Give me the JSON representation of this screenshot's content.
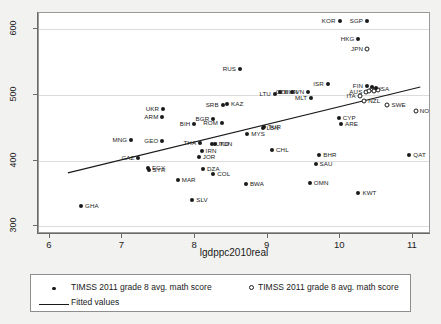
{
  "chart_data": {
    "type": "scatter",
    "title": "",
    "xlabel": "lgdppc2010real",
    "ylabel": "",
    "xlim": [
      5.85,
      11.25
    ],
    "ylim": [
      288,
      625
    ],
    "xticks": [
      "6",
      "7",
      "8",
      "9",
      "10",
      "11"
    ],
    "yticks": [
      "300",
      "400",
      "500",
      "600"
    ],
    "grid": "horizontal",
    "legend_position": "below-plot",
    "series": [
      {
        "name": "TIMSS 2011 grade 8 avg. math score",
        "marker": "filled-circle",
        "points": [
          {
            "label": "GHA",
            "x": 6.43,
            "y": 331,
            "lpos": "right"
          },
          {
            "label": "MNG",
            "x": 7.12,
            "y": 431,
            "lpos": "left"
          },
          {
            "label": "UKR",
            "x": 7.56,
            "y": 479,
            "lpos": "left"
          },
          {
            "label": "ARM",
            "x": 7.55,
            "y": 467,
            "lpos": "left"
          },
          {
            "label": "GEO",
            "x": 7.55,
            "y": 430,
            "lpos": "left"
          },
          {
            "label": "GAZ",
            "x": 7.22,
            "y": 404,
            "lpos": "left"
          },
          {
            "label": "EGY",
            "x": 7.35,
            "y": 388,
            "lpos": "right"
          },
          {
            "label": "SYR",
            "x": 7.36,
            "y": 385,
            "lpos": "right"
          },
          {
            "label": "MAR",
            "x": 7.76,
            "y": 371,
            "lpos": "right"
          },
          {
            "label": "SLV",
            "x": 7.96,
            "y": 340,
            "lpos": "right"
          },
          {
            "label": "BIH",
            "x": 7.99,
            "y": 456,
            "lpos": "left"
          },
          {
            "label": "JOR",
            "x": 8.05,
            "y": 406,
            "lpos": "right"
          },
          {
            "label": "THA",
            "x": 8.07,
            "y": 427,
            "lpos": "left"
          },
          {
            "label": "IRN",
            "x": 8.09,
            "y": 415,
            "lpos": "right"
          },
          {
            "label": "DZA",
            "x": 8.11,
            "y": 387,
            "lpos": "right"
          },
          {
            "label": "BGR",
            "x": 8.25,
            "y": 463,
            "lpos": "left"
          },
          {
            "label": "COL",
            "x": 8.25,
            "y": 379,
            "lpos": "right"
          },
          {
            "label": "TUN",
            "x": 8.28,
            "y": 425,
            "lpos": "right"
          },
          {
            "label": "UKD",
            "x": 8.23,
            "y": 426,
            "lpos": "right"
          },
          {
            "label": "SRB",
            "x": 8.38,
            "y": 485,
            "lpos": "left"
          },
          {
            "label": "KAZ",
            "x": 8.44,
            "y": 486,
            "lpos": "right"
          },
          {
            "label": "ROM",
            "x": 8.37,
            "y": 458,
            "lpos": "left"
          },
          {
            "label": "RUS",
            "x": 8.62,
            "y": 539,
            "lpos": "left"
          },
          {
            "label": "BWA",
            "x": 8.7,
            "y": 364,
            "lpos": "right"
          },
          {
            "label": "MYS",
            "x": 8.72,
            "y": 440,
            "lpos": "right"
          },
          {
            "label": "LBN",
            "x": 8.93,
            "y": 449,
            "lpos": "right"
          },
          {
            "label": "TUR",
            "x": 8.95,
            "y": 451,
            "lpos": "right"
          },
          {
            "label": "CHL",
            "x": 9.06,
            "y": 416,
            "lpos": "right"
          },
          {
            "label": "LTU",
            "x": 9.1,
            "y": 502,
            "lpos": "left"
          },
          {
            "label": "HUN",
            "x": 9.17,
            "y": 505,
            "lpos": "right"
          },
          {
            "label": "CZE",
            "x": 9.34,
            "y": 505,
            "lpos": "left"
          },
          {
            "label": "SVN",
            "x": 9.56,
            "y": 505,
            "lpos": "left"
          },
          {
            "label": "MLT",
            "x": 9.6,
            "y": 496,
            "lpos": "left"
          },
          {
            "label": "OMN",
            "x": 9.58,
            "y": 366,
            "lpos": "right"
          },
          {
            "label": "SAU",
            "x": 9.66,
            "y": 395,
            "lpos": "right"
          },
          {
            "label": "BHR",
            "x": 9.71,
            "y": 409,
            "lpos": "right"
          },
          {
            "label": "ISR",
            "x": 9.83,
            "y": 516,
            "lpos": "left"
          },
          {
            "label": "KOR",
            "x": 9.99,
            "y": 613,
            "lpos": "left"
          },
          {
            "label": "CYP",
            "x": 9.98,
            "y": 465,
            "lpos": "right"
          },
          {
            "label": "ARE",
            "x": 10.01,
            "y": 455,
            "lpos": "right"
          },
          {
            "label": "HKG",
            "x": 10.25,
            "y": 586,
            "lpos": "left"
          },
          {
            "label": "SGP",
            "x": 10.37,
            "y": 613,
            "lpos": "left"
          },
          {
            "label": "KWT",
            "x": 10.25,
            "y": 350,
            "lpos": "right"
          },
          {
            "label": "FIN",
            "x": 10.37,
            "y": 514,
            "lpos": "left"
          },
          {
            "label": "QAT",
            "x": 10.95,
            "y": 409,
            "lpos": "right"
          }
        ]
      },
      {
        "name": "TIMSS 2011 grade 8 avg. math score",
        "marker": "hollow-circle",
        "points": [
          {
            "label": "JPN",
            "x": 10.37,
            "y": 570,
            "lpos": "left"
          },
          {
            "label": "ITA",
            "x": 10.27,
            "y": 498,
            "lpos": "left"
          },
          {
            "label": "NZL",
            "x": 10.33,
            "y": 491,
            "lpos": "right"
          },
          {
            "label": "AUS",
            "x": 10.36,
            "y": 505,
            "lpos": "left"
          },
          {
            "label": "USA",
            "x": 10.44,
            "y": 509,
            "lpos": "right"
          },
          {
            "label": "SWE",
            "x": 10.65,
            "y": 484,
            "lpos": "right"
          },
          {
            "label": "NOR",
            "x": 11.04,
            "y": 475,
            "lpos": "right"
          }
        ]
      }
    ],
    "extra_cluster_points": [
      {
        "x": 10.4,
        "y": 506,
        "marker": "hollow-circle"
      },
      {
        "x": 10.47,
        "y": 506,
        "marker": "hollow-circle"
      },
      {
        "x": 10.52,
        "y": 507,
        "marker": "hollow-circle"
      },
      {
        "x": 10.44,
        "y": 512,
        "marker": "filled-circle"
      },
      {
        "x": 10.49,
        "y": 511,
        "marker": "filled-circle"
      }
    ],
    "fitted_line": {
      "name": "Fitted values",
      "x_start": 6.25,
      "y_start": 379,
      "x_end": 11.13,
      "y_end": 511
    }
  },
  "legend": {
    "entry_filled": "TIMSS 2011 grade 8 avg. math score",
    "entry_hollow": "TIMSS 2011 grade 8 avg. math score",
    "entry_line": "Fitted values"
  }
}
